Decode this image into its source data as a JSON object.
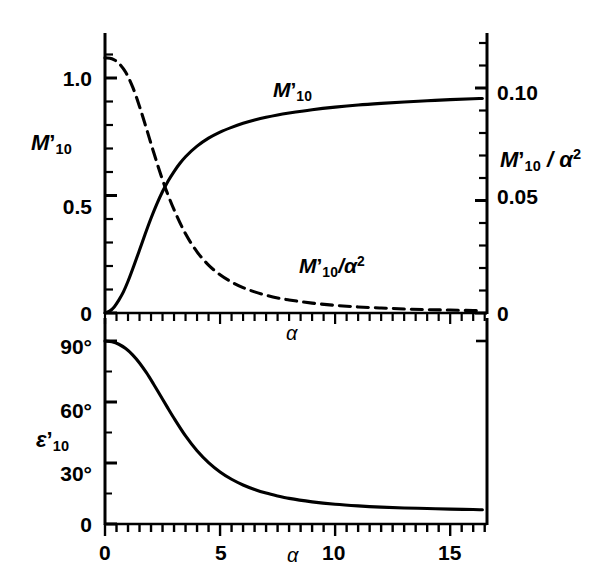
{
  "figure": {
    "background_color": "#ffffff",
    "line_color": "#000000"
  },
  "upper_panel": {
    "left_axis_title": "M'10",
    "right_axis_title": "M'10 / α2",
    "x_axis_title": "α",
    "left_ticks": [
      "0",
      "0.5",
      "1.0"
    ],
    "right_ticks": [
      "0",
      "0.05",
      "0.10"
    ],
    "curve_label_solid": "M'10",
    "curve_label_dashed": "M'10/α2"
  },
  "lower_panel": {
    "y_axis_title": "ε'10",
    "x_axis_title": "α",
    "y_ticks": [
      "0",
      "30°",
      "60°",
      "90°"
    ],
    "x_ticks": [
      "0",
      "5",
      "10",
      "15"
    ]
  },
  "chart_data": {
    "type": "line",
    "title": "",
    "panels": [
      {
        "name": "upper",
        "xlabel": "α",
        "ylabel_left": "M'10",
        "ylabel_right": "M'10 / α2",
        "xlim": [
          0,
          16.6
        ],
        "ylim_left": [
          0,
          1.12
        ],
        "ylim_right": [
          0,
          0.1275
        ],
        "xticks": [
          0,
          5,
          10,
          15
        ],
        "xticks_minor_step": 0.5,
        "yticks_left": [
          0,
          0.5,
          1.0
        ],
        "yticks_left_minor_step": 0.1,
        "yticks_right": [
          0,
          0.05,
          0.1
        ],
        "yticks_right_minor_step": 0.01,
        "grid": false,
        "legend": "inline-annotations",
        "series": [
          {
            "name": "M'10",
            "style": "solid",
            "axis": "left",
            "x": [
              0,
              0.2,
              0.4,
              0.6,
              0.8,
              1.0,
              1.25,
              1.5,
              1.75,
              2.0,
              2.25,
              2.5,
              2.75,
              3.0,
              3.25,
              3.5,
              4.0,
              4.5,
              5.0,
              5.5,
              6.0,
              6.5,
              7.0,
              7.5,
              8.0,
              9.0,
              10.0,
              11.0,
              12.0,
              13.0,
              14.0,
              15.0,
              16.0,
              16.4
            ],
            "y": [
              0.0,
              0.008,
              0.026,
              0.055,
              0.09,
              0.135,
              0.2,
              0.268,
              0.337,
              0.403,
              0.463,
              0.517,
              0.563,
              0.602,
              0.636,
              0.665,
              0.71,
              0.744,
              0.77,
              0.79,
              0.807,
              0.821,
              0.833,
              0.843,
              0.851,
              0.865,
              0.876,
              0.885,
              0.892,
              0.898,
              0.903,
              0.908,
              0.912,
              0.913
            ]
          },
          {
            "name": "M'10/α2",
            "style": "dashed",
            "axis": "right",
            "x": [
              0,
              0.3,
              0.6,
              0.9,
              1.2,
              1.5,
              1.8,
              2.1,
              2.4,
              2.7,
              3.0,
              3.5,
              4.0,
              4.5,
              5.0,
              5.5,
              6.0,
              6.5,
              7.0,
              7.5,
              8.0,
              9.0,
              10.0,
              11.0,
              12.0,
              13.0,
              14.0,
              15.0,
              16.0,
              16.4
            ],
            "y": [
              0.1134,
              0.113,
              0.111,
              0.107,
              0.1005,
              0.0918,
              0.082,
              0.0719,
              0.0622,
              0.0535,
              0.0459,
              0.0352,
              0.0272,
              0.0213,
              0.017,
              0.0138,
              0.0113,
              0.0094,
              0.0079,
              0.0067,
              0.0058,
              0.0044,
              0.0034,
              0.0027,
              0.0022,
              0.0018,
              0.0015,
              0.0013,
              0.0011,
              0.001
            ]
          }
        ]
      },
      {
        "name": "lower",
        "xlabel": "α",
        "ylabel": "ε'10",
        "xlim": [
          0,
          16.6
        ],
        "ylim": [
          0,
          97
        ],
        "xticks": [
          0,
          5,
          10,
          15
        ],
        "xticks_minor_step": 0.5,
        "yticks": [
          0,
          30,
          60,
          90
        ],
        "grid": false,
        "series": [
          {
            "name": "ε'10",
            "style": "solid",
            "x": [
              0,
              0.3,
              0.6,
              0.9,
              1.2,
              1.5,
              1.8,
              2.1,
              2.4,
              2.7,
              3.0,
              3.5,
              4.0,
              4.5,
              5.0,
              5.5,
              6.0,
              6.5,
              7.0,
              7.5,
              8.0,
              9.0,
              10.0,
              11.0,
              12.0,
              13.0,
              14.0,
              15.0,
              16.0,
              16.4
            ],
            "y": [
              90.0,
              89.6,
              88.4,
              86.3,
              83.2,
              79.2,
              74.4,
              69.0,
              63.3,
              57.6,
              52.0,
              43.3,
              36.0,
              30.2,
              25.6,
              22.0,
              19.2,
              17.0,
              15.2,
              13.8,
              12.6,
              10.9,
              9.7,
              8.9,
              8.3,
              7.9,
              7.6,
              7.3,
              7.1,
              7.0
            ]
          }
        ]
      }
    ]
  }
}
